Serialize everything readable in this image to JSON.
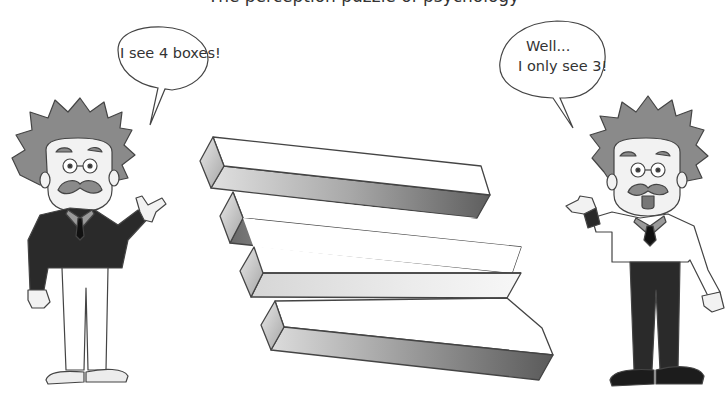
{
  "clipped_caption": "The perception puzzle of psychology",
  "illustration": {
    "type": "impossible-figure",
    "description": "Optical illusion of stacked rectangular bars",
    "bar_count_visible_ends_left": 4,
    "bar_count_visible_ends_right": 3
  },
  "characters": [
    {
      "id": "left-scientist",
      "outfit": "dark sweater, white trousers",
      "speech": [
        "I see 4 boxes!"
      ]
    },
    {
      "id": "right-scientist",
      "outfit": "white shirt, dark trousers",
      "speech": [
        "Well...",
        "I only see 3!"
      ]
    }
  ],
  "colors": {
    "line": "#444444",
    "hair": "#8a8a8a",
    "dark_cloth": "#2a2a2a",
    "skin": "#eeeeee",
    "bar_shade_dark": "#6e6e6e",
    "bar_shade_light": "#dcdcdc"
  }
}
